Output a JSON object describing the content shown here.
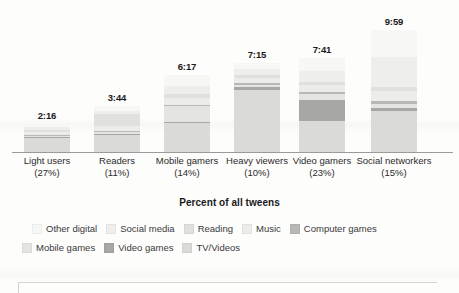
{
  "chart_data": {
    "type": "bar",
    "title": "",
    "subtitle": "",
    "xlabel": "Percent of all tweens",
    "ylabel": "",
    "stacked": true,
    "grid": false,
    "legend_position": "bottom",
    "axis_units": "hours:minutes per day",
    "ylim": [
      0,
      10
    ],
    "categories": [
      "Light users\n(27%)",
      "Readers\n(11%)",
      "Mobile gamers\n(14%)",
      "Heavy viewers\n(10%)",
      "Video gamers\n(23%)",
      "Social networkers\n(15%)"
    ],
    "category_names": [
      "Light users",
      "Readers",
      "Mobile gamers",
      "Heavy viewers",
      "Video gamers",
      "Social networkers"
    ],
    "category_percents": [
      "(27%)",
      "(11%)",
      "(14%)",
      "(10%)",
      "(23%)",
      "(15%)"
    ],
    "totals_label": [
      "2:16",
      "3:44",
      "6:17",
      "7:15",
      "7:41",
      "9:59"
    ],
    "totals_hours": [
      2.27,
      3.73,
      6.28,
      7.25,
      7.68,
      9.98
    ],
    "series": [
      {
        "name": "TV/Videos",
        "color": "#dadad6",
        "values": [
          1.15,
          1.4,
          2.35,
          5.1,
          2.55,
          3.35
        ]
      },
      {
        "name": "Video games",
        "color": "#a7a7a3",
        "values": [
          0.06,
          0.09,
          0.12,
          0.18,
          1.7,
          0.28
        ]
      },
      {
        "name": "Mobile games",
        "color": "#e4e4e0",
        "values": [
          0.1,
          0.12,
          1.3,
          0.22,
          0.45,
          0.3
        ]
      },
      {
        "name": "Computer games",
        "color": "#b8b8b4",
        "values": [
          0.05,
          0.07,
          0.1,
          0.14,
          0.18,
          0.22
        ]
      },
      {
        "name": "Music",
        "color": "#ececea",
        "values": [
          0.25,
          0.45,
          0.55,
          0.4,
          0.62,
          0.85
        ]
      },
      {
        "name": "Reading",
        "color": "#e0e0dc",
        "values": [
          0.2,
          1.0,
          0.28,
          0.26,
          0.24,
          0.3
        ]
      },
      {
        "name": "Social media",
        "color": "#eeeeec",
        "values": [
          0.2,
          0.26,
          0.7,
          0.5,
          0.85,
          2.45
        ]
      },
      {
        "name": "Other digital",
        "color": "#f7f7f5",
        "values": [
          0.26,
          0.34,
          0.88,
          0.45,
          1.09,
          2.23
        ]
      }
    ]
  },
  "legend": {
    "row1": [
      {
        "label": "Other digital",
        "color": "#f7f7f5"
      },
      {
        "label": "Social media",
        "color": "#eeeeec"
      },
      {
        "label": "Reading",
        "color": "#e0e0dc"
      },
      {
        "label": "Music",
        "color": "#ececea"
      },
      {
        "label": "Computer games",
        "color": "#b8b8b4"
      }
    ],
    "row2": [
      {
        "label": "Mobile games",
        "color": "#e4e4e0"
      },
      {
        "label": "Video games",
        "color": "#a7a7a3"
      },
      {
        "label": "TV/Videos",
        "color": "#dadad6"
      }
    ]
  }
}
